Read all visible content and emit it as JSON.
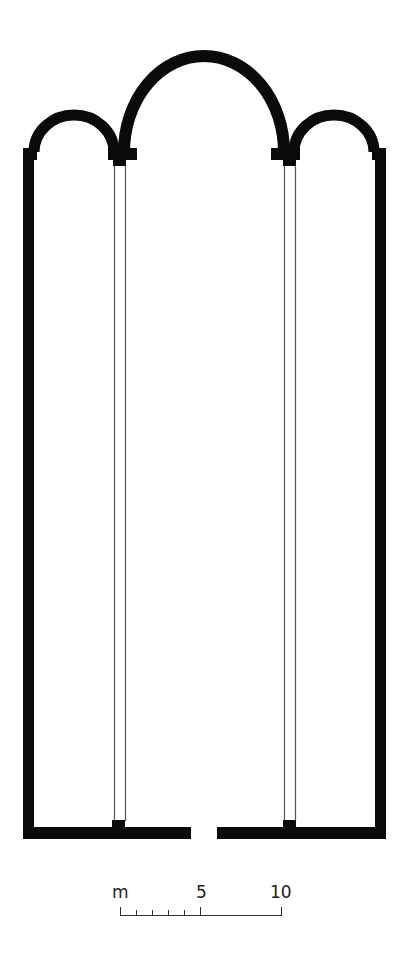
{
  "diagram": {
    "type": "architectural-floor-plan",
    "colors": {
      "wall": "#0a0a0a",
      "column_outline": "#555555",
      "background": "#ffffff",
      "scale": "#333333"
    },
    "elements": {
      "apses": [
        "left-apse",
        "central-apse",
        "right-apse"
      ],
      "colonnades": [
        "left-colonnade",
        "right-colonnade"
      ],
      "entrance": "central-doorway"
    }
  },
  "scale_bar": {
    "unit_label": "m",
    "mid_label": "5",
    "end_label": "10",
    "minor_ticks": 5
  }
}
